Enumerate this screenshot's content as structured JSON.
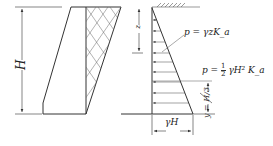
{
  "diagram": {
    "labels": {
      "height": "H",
      "depth": "z",
      "pressure_at_depth": "p = γzK_a",
      "resultant_p": "p =",
      "resultant_frac_num": "1",
      "resultant_frac_den": "2",
      "resultant_tail": "γH² K_a",
      "resultant_location": "y = H/3",
      "base_pressure": "γH"
    },
    "colors": {
      "line": "#333333",
      "background": "#ffffff"
    }
  }
}
